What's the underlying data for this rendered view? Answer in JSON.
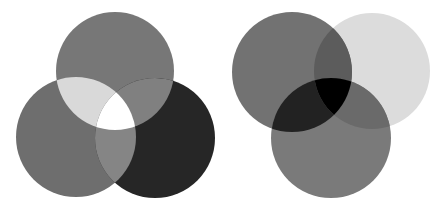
{
  "diagrams": [
    {
      "name": "left-three-circle-mix",
      "circles": [
        {
          "id": "top",
          "cx": 115,
          "cy": 71,
          "r": 59,
          "fill": "#777777"
        },
        {
          "id": "left",
          "cx": 76,
          "cy": 137,
          "r": 60,
          "fill": "#6e6e6e"
        },
        {
          "id": "right",
          "cx": 155,
          "cy": 138,
          "r": 60,
          "fill": "#262626"
        }
      ],
      "overlaps": {
        "top_left": "#d9d9d9",
        "top_right": "#808080",
        "left_right": "#858585",
        "center": "#ffffff"
      }
    },
    {
      "name": "right-three-circle-mix",
      "circles": [
        {
          "id": "left",
          "cx": 292,
          "cy": 72,
          "r": 60,
          "fill": "#727272"
        },
        {
          "id": "right",
          "cx": 372,
          "cy": 71,
          "r": 58,
          "fill": "#dcdcdc"
        },
        {
          "id": "bottom",
          "cx": 331,
          "cy": 138,
          "r": 60,
          "fill": "#7a7a7a"
        }
      ],
      "overlaps": {
        "left_right": "#5c5c5c",
        "left_bottom": "#222222",
        "right_bottom": "#6a6a6a",
        "center": "#000000"
      }
    }
  ],
  "background": "#ffffff"
}
